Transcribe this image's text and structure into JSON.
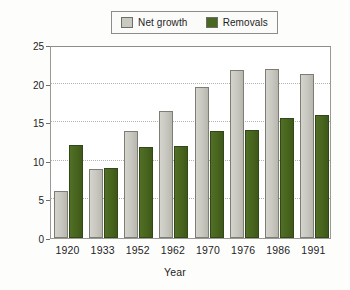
{
  "chart_data": {
    "type": "bar",
    "title": "",
    "xlabel": "Year",
    "ylabel": "Billion cubic feet per year",
    "categories": [
      "1920",
      "1933",
      "1952",
      "1962",
      "1970",
      "1976",
      "1986",
      "1991"
    ],
    "series": [
      {
        "name": "Net growth",
        "color": "#c9c9c2",
        "values": [
          6.1,
          8.9,
          13.8,
          16.4,
          19.6,
          21.7,
          21.9,
          21.3
        ]
      },
      {
        "name": "Removals",
        "color": "#4a6821",
        "values": [
          12.0,
          9.1,
          11.8,
          11.9,
          13.8,
          14.0,
          15.6,
          15.9
        ]
      }
    ],
    "ylim": [
      0,
      25
    ],
    "yticks": [
      0,
      5,
      10,
      15,
      20,
      25
    ],
    "ytick_labels": [
      "0",
      "5",
      "10",
      "15",
      "20",
      "25"
    ],
    "grid": "horizontal-dotted",
    "legend_position": "top-center"
  },
  "legend": {
    "items": [
      {
        "label": "Net growth",
        "swatch": "net-growth-swatch"
      },
      {
        "label": "Removals",
        "swatch": "removals-swatch"
      }
    ]
  }
}
